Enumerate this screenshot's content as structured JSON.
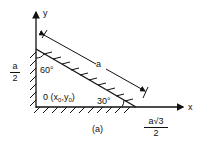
{
  "diagram": {
    "axes": {
      "x_label": "x",
      "y_label": "y"
    },
    "origin_label": "0",
    "origin_coords": {
      "prefix": "(x",
      "sub0": "0",
      "mid": ",y",
      "sub1": "0",
      "suffix": ")"
    },
    "angles": {
      "top": "60°",
      "bottom": "30°"
    },
    "hypotenuse_label": "a",
    "left_fraction": {
      "num": "a",
      "den": "2"
    },
    "bottom_fraction": {
      "num": "a√3",
      "den": "2"
    },
    "caption": "(a)",
    "colors": {
      "ink": "#111111",
      "background": "#ffffff"
    }
  }
}
